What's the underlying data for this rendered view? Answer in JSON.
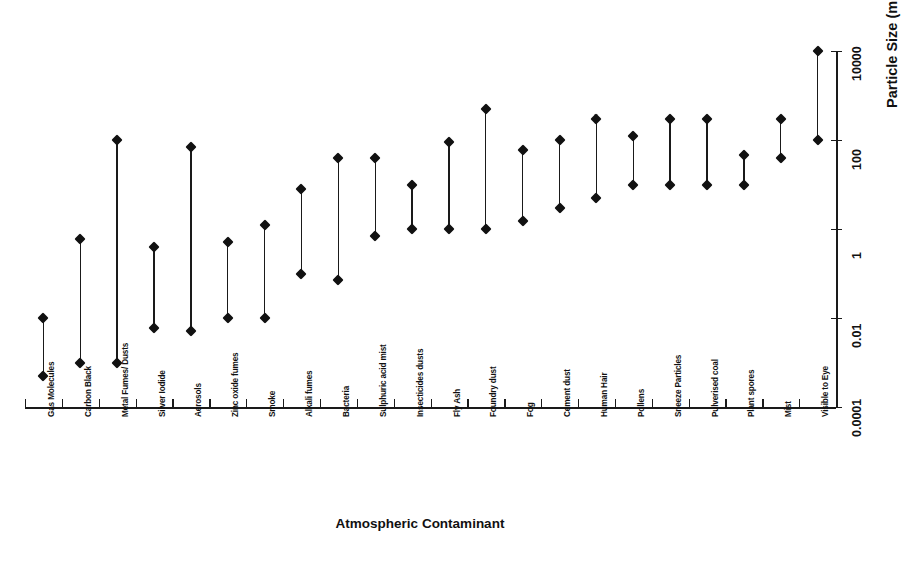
{
  "chart_data": {
    "type": "range",
    "title": "",
    "xlabel": "Atmospheric Contaminant",
    "ylabel": "Particle Size (micrometres)",
    "yscale": "log",
    "ylim": [
      0.0001,
      10000
    ],
    "ytick_labels": [
      "0.0001",
      "0.01",
      "1",
      "100",
      "10000"
    ],
    "ytick_values": [
      0.0001,
      0.01,
      1,
      100,
      10000
    ],
    "grid": false,
    "legend": "none",
    "categories": [
      "Gas Molecules",
      "Carbon Black",
      "Metal Fumes/ Dusts",
      "Silver Iodide",
      "Aerosols",
      "Zinc oxide fumes",
      "Smoke",
      "Alkali fumes",
      "Bacteria",
      "Sulphuric acid mist",
      "Insecticides dusts",
      "Fly Ash",
      "Foundry dust",
      "Fog",
      "Cement dust",
      "Human Hair",
      "Pollens",
      "Sneeze Particles",
      "Pulverised coal",
      "Plant spores",
      "Mist",
      "Visible to Eye"
    ],
    "series": [
      {
        "name": "min",
        "values": [
          0.0005,
          0.001,
          0.001,
          0.006,
          0.005,
          0.01,
          0.01,
          0.1,
          0.07,
          0.7,
          1.0,
          1.0,
          1.0,
          1.5,
          3.0,
          5.0,
          10.0,
          10.0,
          10.0,
          10.0,
          40.0,
          100.0
        ]
      },
      {
        "name": "max",
        "values": [
          0.01,
          0.6,
          100.0,
          0.4,
          70.0,
          0.5,
          1.2,
          8.0,
          40.0,
          40.0,
          10.0,
          90.0,
          500.0,
          60.0,
          100.0,
          300.0,
          120.0,
          300.0,
          300.0,
          45.0,
          300.0,
          10000.0
        ]
      }
    ]
  },
  "axis": {
    "y_title": "Particle Size (micrometres)",
    "x_title": "Atmospheric Contaminant"
  }
}
